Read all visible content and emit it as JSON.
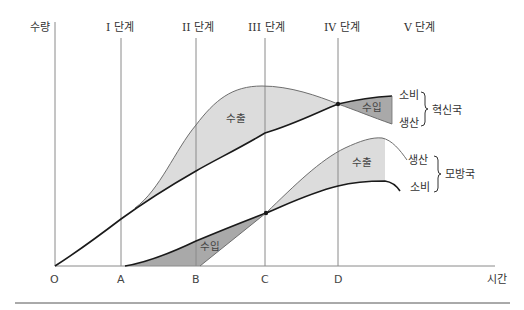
{
  "diagram": {
    "type": "product-life-cycle-trade",
    "y_axis_label": "수량",
    "x_axis_label": "시간",
    "origin_label": "O",
    "time_points": [
      "A",
      "B",
      "C",
      "D"
    ],
    "stages": [
      "I 단계",
      "II 단계",
      "III 단계",
      "IV 단계",
      "V 단계"
    ],
    "innovator": {
      "group_label": "혁신국",
      "consumption_label": "소비",
      "production_label": "생산",
      "export_label": "수출",
      "import_label": "수입"
    },
    "imitator": {
      "group_label": "모방국",
      "production_label": "생산",
      "consumption_label": "소비",
      "export_label": "수출",
      "import_label": "수입"
    },
    "colors": {
      "export_fill": "#dcdcdc",
      "import_fill": "#a9a9a9",
      "curve_bold": "#1a1a1a",
      "curve_thin": "#6e6e6e",
      "guide_line": "#8a8a8a"
    }
  }
}
